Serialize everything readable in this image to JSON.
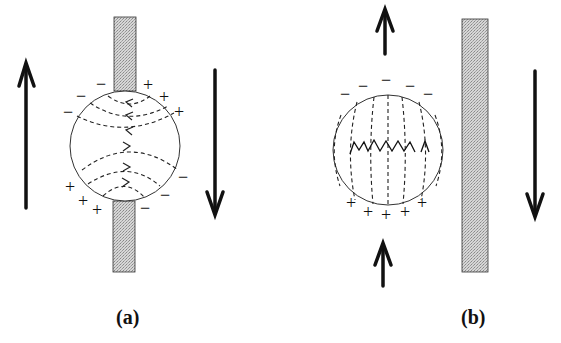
{
  "figure": {
    "panels": [
      {
        "id": "a",
        "label": "(a)",
        "description": "Sphere between split conductor strip; opposing motion arrows; curved field lines with charges distributed obliquely",
        "charges": {
          "negative_top_left": [
            "−",
            "−",
            "−"
          ],
          "positive_top_right": [
            "+",
            "+",
            "+"
          ],
          "positive_bottom_left": [
            "+",
            "+",
            "+"
          ],
          "negative_bottom_right": [
            "−",
            "−",
            "−"
          ]
        },
        "arrows": [
          {
            "side": "left",
            "direction": "up"
          },
          {
            "side": "right",
            "direction": "down"
          }
        ]
      },
      {
        "id": "b",
        "label": "(b)",
        "description": "Sphere beside conductor strip; field lines vertical; negative charges top, positive charges bottom",
        "charges": {
          "negative_top": [
            "−",
            "−",
            "−",
            "−",
            "−"
          ],
          "positive_bottom": [
            "+",
            "+",
            "+",
            "+",
            "+"
          ]
        },
        "arrows": [
          {
            "side": "top",
            "direction": "up"
          },
          {
            "side": "bottom",
            "direction": "up"
          },
          {
            "side": "right",
            "direction": "down"
          }
        ]
      }
    ],
    "colors": {
      "ink": "#111111",
      "strip_fill": "#c8c8c8",
      "background": "#ffffff"
    }
  }
}
